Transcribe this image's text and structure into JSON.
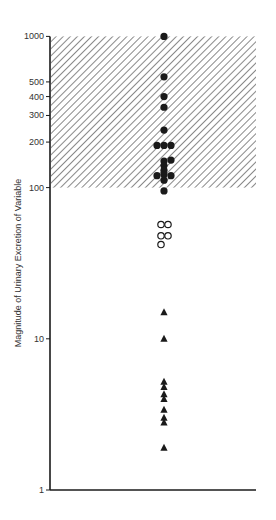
{
  "chart_data": {
    "type": "scatter",
    "title": "",
    "xlabel": "",
    "ylabel": "Magnitude of Urinary Excretion of Variable",
    "yscale": "log",
    "ylim": [
      1,
      1000
    ],
    "yticks": [
      1,
      10,
      100,
      200,
      300,
      400,
      500,
      1000
    ],
    "ytick_labels": [
      "1",
      "10",
      "100",
      "200",
      "300",
      "400",
      "500",
      "1000"
    ],
    "grid": false,
    "legend": null,
    "shaded_region": {
      "y_from": 100,
      "y_to": 1000,
      "pattern": "diagonal-hatch"
    },
    "series": [
      {
        "name": "filled-circles",
        "marker": "filled-circle",
        "color": "#1a1a1a",
        "points": [
          {
            "x": 0,
            "y": 1000
          },
          {
            "x": 0,
            "y": 540
          },
          {
            "x": 0,
            "y": 400
          },
          {
            "x": 0,
            "y": 340
          },
          {
            "x": 0,
            "y": 240
          },
          {
            "x": -1,
            "y": 190
          },
          {
            "x": 0,
            "y": 190
          },
          {
            "x": 1,
            "y": 190
          },
          {
            "x": 0,
            "y": 150
          },
          {
            "x": 1,
            "y": 152
          },
          {
            "x": 0,
            "y": 140
          },
          {
            "x": 0,
            "y": 130
          },
          {
            "x": -1,
            "y": 120
          },
          {
            "x": 0,
            "y": 122
          },
          {
            "x": 1,
            "y": 120
          },
          {
            "x": 0,
            "y": 112
          },
          {
            "x": 0,
            "y": 95
          }
        ]
      },
      {
        "name": "open-circles",
        "marker": "open-circle",
        "color": "#1a1a1a",
        "points": [
          {
            "x": 0,
            "y": 57
          },
          {
            "x": 1,
            "y": 57
          },
          {
            "x": 0,
            "y": 48
          },
          {
            "x": 1,
            "y": 48
          },
          {
            "x": 0,
            "y": 42
          }
        ]
      },
      {
        "name": "triangles",
        "marker": "filled-triangle",
        "color": "#1a1a1a",
        "points": [
          {
            "x": 0,
            "y": 15
          },
          {
            "x": 0,
            "y": 10
          },
          {
            "x": 0,
            "y": 5.2
          },
          {
            "x": 0,
            "y": 4.8
          },
          {
            "x": 0,
            "y": 4.3
          },
          {
            "x": 0,
            "y": 4.0
          },
          {
            "x": 0,
            "y": 3.4
          },
          {
            "x": 0,
            "y": 3.0
          },
          {
            "x": 0,
            "y": 2.8
          },
          {
            "x": 0,
            "y": 1.9
          }
        ]
      }
    ]
  },
  "layout": {
    "axis_color": "#1a1a1a",
    "hatch_color": "#555555"
  }
}
